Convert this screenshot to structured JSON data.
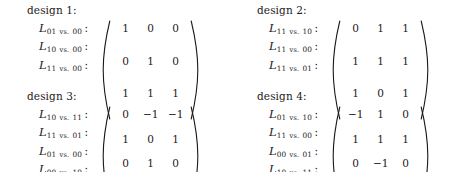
{
  "figure": {
    "designs": [
      {
        "title": "design 1:",
        "rows": [
          {
            "symbol": "L",
            "sub_a": "01",
            "vs": "vs.",
            "sub_b": "00",
            "colon": ":",
            "values": [
              "1",
              "0",
              "0"
            ]
          },
          {
            "symbol": "L",
            "sub_a": "10",
            "vs": "vs.",
            "sub_b": "00",
            "colon": ":",
            "values": [
              "0",
              "1",
              "0"
            ]
          },
          {
            "symbol": "L",
            "sub_a": "11",
            "vs": "vs.",
            "sub_b": "00",
            "colon": ":",
            "values": [
              "1",
              "1",
              "1"
            ]
          }
        ]
      },
      {
        "title": "design 2:",
        "rows": [
          {
            "symbol": "L",
            "sub_a": "11",
            "vs": "vs.",
            "sub_b": "10",
            "colon": ":",
            "values": [
              "0",
              "1",
              "1"
            ]
          },
          {
            "symbol": "L",
            "sub_a": "11",
            "vs": "vs.",
            "sub_b": "00",
            "colon": ":",
            "values": [
              "1",
              "1",
              "1"
            ]
          },
          {
            "symbol": "L",
            "sub_a": "11",
            "vs": "vs.",
            "sub_b": "01",
            "colon": ":",
            "values": [
              "1",
              "0",
              "1"
            ]
          }
        ]
      },
      {
        "title": "design 3:",
        "rows": [
          {
            "symbol": "L",
            "sub_a": "10",
            "vs": "vs.",
            "sub_b": "11",
            "colon": ":",
            "values": [
              "0",
              "−1",
              "−1"
            ]
          },
          {
            "symbol": "L",
            "sub_a": "11",
            "vs": "vs.",
            "sub_b": "01",
            "colon": ":",
            "values": [
              "1",
              "0",
              "1"
            ]
          },
          {
            "symbol": "L",
            "sub_a": "01",
            "vs": "vs.",
            "sub_b": "00",
            "colon": ":",
            "values": [
              "0",
              "1",
              "0"
            ]
          },
          {
            "symbol": "L",
            "sub_a": "00",
            "vs": "vs.",
            "sub_b": "10",
            "colon": ":",
            "values": [
              "−1",
              "0",
              "0"
            ]
          }
        ]
      },
      {
        "title": "design 4:",
        "rows": [
          {
            "symbol": "L",
            "sub_a": "01",
            "vs": "vs.",
            "sub_b": "10",
            "colon": ":",
            "values": [
              "−1",
              "1",
              "0"
            ]
          },
          {
            "symbol": "L",
            "sub_a": "11",
            "vs": "vs.",
            "sub_b": "00",
            "colon": ":",
            "values": [
              "1",
              "1",
              "1"
            ]
          },
          {
            "symbol": "L",
            "sub_a": "00",
            "vs": "vs.",
            "sub_b": "01",
            "colon": ":",
            "values": [
              "0",
              "−1",
              "0"
            ]
          },
          {
            "symbol": "L",
            "sub_a": "10",
            "vs": "vs.",
            "sub_b": "11",
            "colon": ":",
            "values": [
              "0",
              "−1",
              "−1"
            ]
          }
        ]
      }
    ]
  },
  "colors": {
    "background": "#ffffff",
    "text": "#1a1a1a"
  }
}
